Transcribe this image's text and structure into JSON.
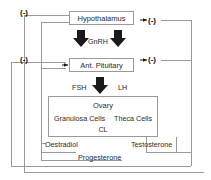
{
  "diagram": {
    "nodes": {
      "hypothalamus": "Hypothalamus",
      "pituitary": "Ant. Pituitary",
      "ovary": {
        "title": "Ovary",
        "granulosa": "Granulosa Cells",
        "theca": "Theca Cells",
        "cl": "CL"
      }
    },
    "hormones": {
      "gnrh": "GnRH",
      "fsh": "FSH",
      "lh": "LH",
      "oestradiol": "Oestradiol",
      "progesterone": "Progesterone",
      "testosterone": "Testosterone"
    },
    "feedback": {
      "top_left": "(-)",
      "mid_left": "(-)",
      "top_right": "(-)",
      "mid_right": "(-)"
    },
    "colors": {
      "line": "#9a9a9a",
      "arrow_fill": "#1a1a1a",
      "text": "#2b2b2b",
      "background": "#ffffff"
    }
  }
}
